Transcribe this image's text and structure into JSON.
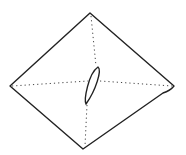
{
  "diagram": {
    "stroke_color": "#222222",
    "background": "#ffffff",
    "vertices": {
      "top": [
        90,
        13
      ],
      "left": [
        10,
        86
      ],
      "right": [
        174,
        87
      ],
      "bottom": [
        83,
        149
      ]
    },
    "center_oval": {
      "top": [
        98,
        67
      ],
      "bottom": [
        86,
        104
      ]
    }
  }
}
